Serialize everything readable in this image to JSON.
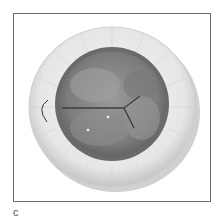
{
  "figure": {
    "panel_label": "c",
    "colors": {
      "frame": "#6e6e6e",
      "cuff": "#e8e8e8",
      "cuff_shadow": "#bdbdbd",
      "leaflet": "#8a8a8a",
      "leaflet_dark": "#5e5e5e",
      "suture": "#333333"
    }
  }
}
